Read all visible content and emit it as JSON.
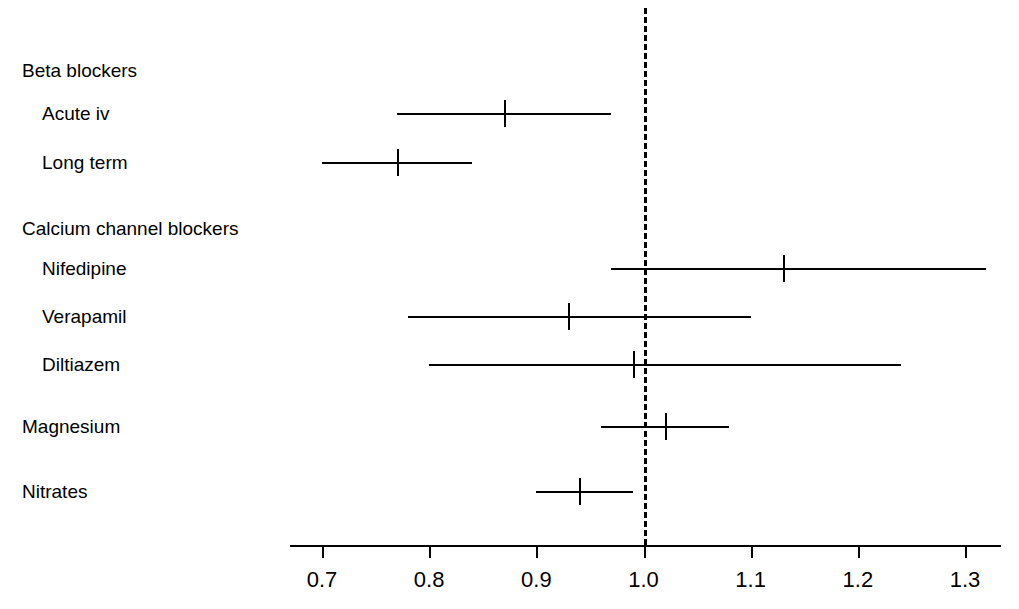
{
  "chart_data": {
    "type": "scatter",
    "title": "",
    "xlabel": "",
    "ylabel": "",
    "xlim": [
      0.65,
      1.36
    ],
    "grid": false,
    "legend": "none",
    "null_line": 1.0,
    "xticks": [
      "0.7",
      "0.8",
      "0.9",
      "1.0",
      "1.1",
      "1.2",
      "1.3"
    ],
    "xtick_values": [
      0.7,
      0.8,
      0.9,
      1.0,
      1.1,
      1.2,
      1.3
    ],
    "rows": [
      {
        "label": "Beta blockers",
        "kind": "group",
        "indent": 0
      },
      {
        "label": "Acute iv",
        "kind": "estimate",
        "indent": 1,
        "estimate": 0.87,
        "lower": 0.77,
        "upper": 0.97
      },
      {
        "label": "Long term",
        "kind": "estimate",
        "indent": 1,
        "estimate": 0.77,
        "lower": 0.7,
        "upper": 0.84
      },
      {
        "label": "Calcium channel blockers",
        "kind": "group",
        "indent": 0
      },
      {
        "label": "Nifedipine",
        "kind": "estimate",
        "indent": 1,
        "estimate": 1.13,
        "lower": 0.97,
        "upper": 1.32
      },
      {
        "label": "Verapamil",
        "kind": "estimate",
        "indent": 1,
        "estimate": 0.93,
        "lower": 0.78,
        "upper": 1.1
      },
      {
        "label": "Diltiazem",
        "kind": "estimate",
        "indent": 1,
        "estimate": 0.99,
        "lower": 0.8,
        "upper": 1.24
      },
      {
        "label": "Magnesium",
        "kind": "estimate",
        "indent": 0,
        "estimate": 1.02,
        "lower": 0.96,
        "upper": 1.08
      },
      {
        "label": "Nitrates",
        "kind": "estimate",
        "indent": 0,
        "estimate": 0.94,
        "lower": 0.9,
        "upper": 0.99
      }
    ]
  },
  "colors": {
    "ink": "#000000",
    "background": "#ffffff"
  }
}
